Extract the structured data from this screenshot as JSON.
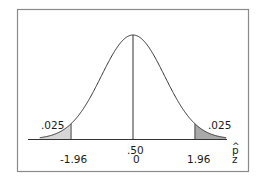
{
  "chart_data": {
    "type": "area",
    "title": "",
    "distribution": "standard normal",
    "xlabel_top": "p̂",
    "xlabel_bottom": "z",
    "mean_label_phat": ".50",
    "mean_label_z": "0",
    "critical_values": [
      -1.96,
      1.96
    ],
    "tick_labels_z": [
      "-1.96",
      "0",
      "1.96"
    ],
    "tail_areas": [
      {
        "side": "left",
        "label": ".025",
        "value": 0.025,
        "from": "-inf",
        "to": -1.96
      },
      {
        "side": "right",
        "label": ".025",
        "value": 0.025,
        "from": 1.96,
        "to": "inf"
      }
    ],
    "center_line": true,
    "grid": false,
    "legend": null
  },
  "colors": {
    "curve": "#333333",
    "left_tail_fill": "#d6d6d6",
    "right_tail_fill": "#a9a9a9",
    "frame": "#8a8a8a",
    "axis": "#333333"
  },
  "labels": {
    "left_tail": ".025",
    "right_tail": ".025",
    "center_phat": ".50",
    "center_z": "0",
    "left_crit": "-1.96",
    "right_crit": "1.96",
    "phat_axis": "p",
    "phat_hat": "^",
    "z_axis": "z"
  }
}
